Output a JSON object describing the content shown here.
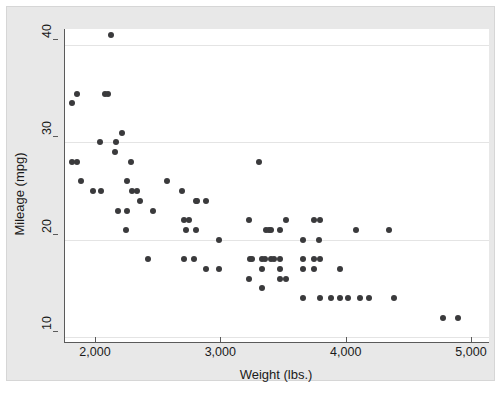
{
  "chart_data": {
    "type": "scatter",
    "title": "",
    "xlabel": "Weight (lbs.)",
    "ylabel": "Mileage (mpg)",
    "xlim": [
      1600,
      4900
    ],
    "ylim": [
      9.0,
      42.5
    ],
    "xticks": [
      2000,
      3000,
      4000,
      5000
    ],
    "xticklabels": [
      "2,000",
      "3,000",
      "4,000",
      "5,000"
    ],
    "yticks": [
      10,
      20,
      30,
      40
    ],
    "yticklabels": [
      "10",
      "20",
      "30",
      "40"
    ],
    "grid": "horizontal",
    "legend": "none",
    "marker_color": "#3a3a3c",
    "plot_bg": "#ffffff",
    "graph_bg": "#e8e8e8",
    "gridline_color": "#e4e4e4",
    "axis_color": "#5a5a5a",
    "n_points": 74,
    "points": [
      [
        2070,
        41
      ],
      [
        1800,
        35
      ],
      [
        2020,
        35
      ],
      [
        2050,
        35
      ],
      [
        1760,
        34
      ],
      [
        2160,
        31
      ],
      [
        1980,
        30
      ],
      [
        2110,
        30
      ],
      [
        2100,
        29
      ],
      [
        1760,
        28
      ],
      [
        1800,
        28
      ],
      [
        2230,
        28
      ],
      [
        1830,
        26
      ],
      [
        2200,
        26
      ],
      [
        2520,
        26
      ],
      [
        1930,
        25
      ],
      [
        1990,
        25
      ],
      [
        2240,
        25
      ],
      [
        2280,
        25
      ],
      [
        2640,
        25
      ],
      [
        2300,
        24
      ],
      [
        2750,
        24
      ],
      [
        2760,
        24
      ],
      [
        2830,
        24
      ],
      [
        2130,
        23
      ],
      [
        2200,
        23
      ],
      [
        2410,
        23
      ],
      [
        2650,
        22
      ],
      [
        2690,
        22
      ],
      [
        3170,
        22
      ],
      [
        3470,
        22
      ],
      [
        3690,
        22
      ],
      [
        3740,
        22
      ],
      [
        2190,
        21
      ],
      [
        2670,
        21
      ],
      [
        2750,
        21
      ],
      [
        3310,
        21
      ],
      [
        3330,
        21
      ],
      [
        3350,
        21
      ],
      [
        3420,
        21
      ],
      [
        2930,
        20
      ],
      [
        3600,
        20
      ],
      [
        3730,
        20
      ],
      [
        3250,
        28
      ],
      [
        2370,
        18
      ],
      [
        2650,
        18
      ],
      [
        2730,
        18
      ],
      [
        3180,
        18
      ],
      [
        3200,
        18
      ],
      [
        3280,
        18
      ],
      [
        3300,
        18
      ],
      [
        3350,
        18
      ],
      [
        3370,
        18
      ],
      [
        3420,
        18
      ],
      [
        3600,
        18
      ],
      [
        3690,
        18
      ],
      [
        3740,
        18
      ],
      [
        2830,
        17
      ],
      [
        2930,
        17
      ],
      [
        3280,
        17
      ],
      [
        3420,
        17
      ],
      [
        3600,
        17
      ],
      [
        3690,
        17
      ],
      [
        3900,
        17
      ],
      [
        4030,
        21
      ],
      [
        4290,
        21
      ],
      [
        3170,
        16
      ],
      [
        3420,
        16
      ],
      [
        3470,
        16
      ],
      [
        3600,
        14
      ],
      [
        3740,
        14
      ],
      [
        3830,
        14
      ],
      [
        3900,
        14
      ],
      [
        3960,
        14
      ],
      [
        4060,
        14
      ],
      [
        4130,
        14
      ],
      [
        4330,
        14
      ],
      [
        3280,
        15
      ],
      [
        4720,
        12
      ],
      [
        4840,
        12
      ]
    ]
  }
}
